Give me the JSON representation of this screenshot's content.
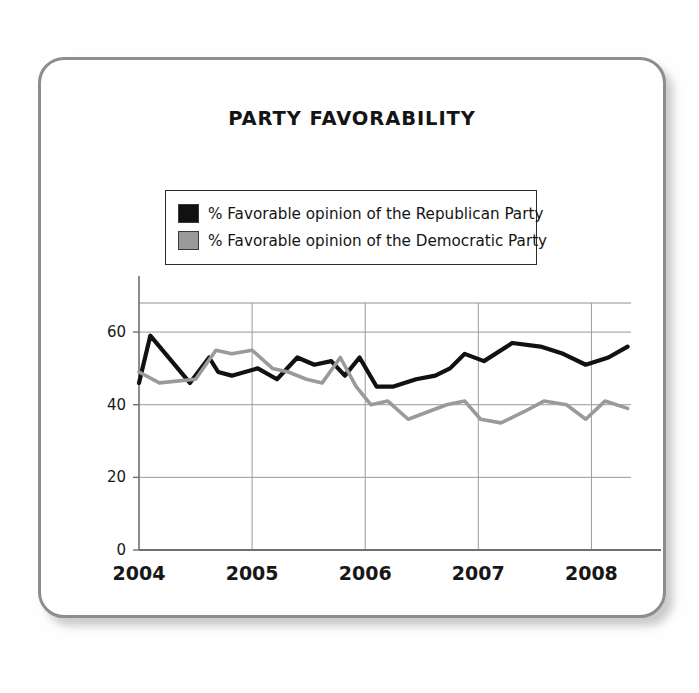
{
  "card": {
    "title": "PARTY FAVORABILITY"
  },
  "legend": {
    "items": [
      {
        "label": "% Favorable opinion of the Republican Party",
        "color": "#111111",
        "swatch": "legend-swatch-republican"
      },
      {
        "label": "% Favorable opinion of the Democratic Party",
        "color": "#9a9a9a",
        "swatch": "legend-swatch-democratic"
      }
    ]
  },
  "axis": {
    "y_ticks": [
      "0",
      "20",
      "40",
      "60"
    ],
    "x_ticks": [
      "2004",
      "2005",
      "2006",
      "2007",
      "2008"
    ]
  },
  "chart_data": {
    "type": "line",
    "title": "PARTY FAVORABILITY",
    "xlabel": "",
    "ylabel": "",
    "xlim": [
      2004.0,
      2008.35
    ],
    "ylim": [
      0,
      68
    ],
    "y_ticks": [
      0,
      20,
      40,
      60
    ],
    "x_ticks": [
      2004,
      2005,
      2006,
      2007,
      2008
    ],
    "grid": true,
    "legend_position": "top-center",
    "series": [
      {
        "name": "% Favorable opinion of the Republican Party",
        "color": "#111111",
        "x": [
          2004.0,
          2004.1,
          2004.45,
          2004.62,
          2004.7,
          2004.82,
          2005.05,
          2005.22,
          2005.4,
          2005.55,
          2005.7,
          2005.82,
          2005.95,
          2006.1,
          2006.25,
          2006.45,
          2006.62,
          2006.75,
          2006.88,
          2007.05,
          2007.3,
          2007.55,
          2007.75,
          2007.95,
          2008.15,
          2008.32
        ],
        "y": [
          46,
          59,
          46,
          53,
          49,
          48,
          50,
          47,
          53,
          51,
          52,
          48,
          53,
          45,
          45,
          47,
          48,
          50,
          54,
          52,
          57,
          56,
          54,
          51,
          53,
          56
        ]
      },
      {
        "name": "% Favorable opinion of the Democratic Party",
        "color": "#9a9a9a",
        "x": [
          2004.0,
          2004.18,
          2004.5,
          2004.68,
          2004.82,
          2005.0,
          2005.18,
          2005.32,
          2005.48,
          2005.62,
          2005.78,
          2005.92,
          2006.05,
          2006.2,
          2006.38,
          2006.55,
          2006.72,
          2006.88,
          2007.02,
          2007.2,
          2007.4,
          2007.58,
          2007.78,
          2007.95,
          2008.12,
          2008.32
        ],
        "y": [
          49,
          46,
          47,
          55,
          54,
          55,
          50,
          49,
          47,
          46,
          53,
          45,
          40,
          41,
          36,
          38,
          40,
          41,
          36,
          35,
          38,
          41,
          40,
          36,
          41,
          39
        ]
      }
    ]
  }
}
